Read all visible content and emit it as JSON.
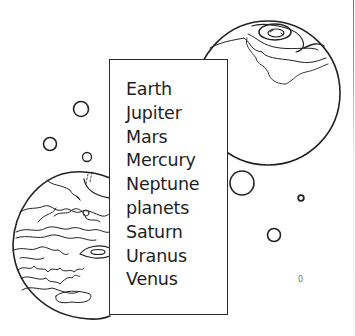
{
  "illustration": {
    "description": "Coloring-page style planets word list",
    "line_color": "#222222",
    "background": "#ffffff"
  },
  "word_box": {
    "words": [
      "Earth",
      "Jupiter",
      "Mars",
      "Mercury",
      "Neptune",
      "planets",
      "Saturn",
      "Uranus",
      "Venus"
    ]
  },
  "planets": [
    {
      "name": "earth-planet",
      "cx": 268,
      "cy": 93,
      "r": 72
    },
    {
      "name": "jupiter-planet",
      "cx": 88,
      "cy": 245,
      "r": 74
    }
  ],
  "bubbles": [
    {
      "cx": 81,
      "cy": 109,
      "r": 7.5
    },
    {
      "cx": 50,
      "cy": 144,
      "r": 6.5
    },
    {
      "cx": 87,
      "cy": 157,
      "r": 4.5
    },
    {
      "cx": 242,
      "cy": 183,
      "r": 12
    },
    {
      "cx": 301,
      "cy": 198,
      "r": 2.8
    },
    {
      "cx": 274,
      "cy": 235,
      "r": 6.5
    }
  ],
  "stray_mark": "0"
}
